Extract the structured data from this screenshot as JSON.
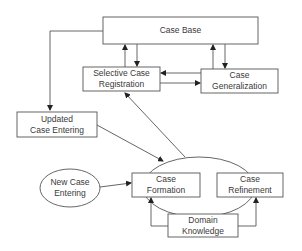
{
  "diagram": {
    "type": "flowchart",
    "colors": {
      "line": "#4a4a4a",
      "text": "#3a3a3a",
      "background": "#ffffff"
    },
    "nodes": {
      "case_base": {
        "shape": "rectangle",
        "label": "Case Base"
      },
      "selective_case_registration": {
        "shape": "rectangle",
        "line1": "Selective Case",
        "line2": "Registration"
      },
      "case_generalization": {
        "shape": "rectangle",
        "line1": "Case",
        "line2": "Generalization"
      },
      "updated_case_entering": {
        "shape": "rectangle",
        "line1": "Updated",
        "line2": "Case Entering"
      },
      "new_case_entering": {
        "shape": "ellipse",
        "line1": "New Case",
        "line2": "Entering"
      },
      "case_formation": {
        "shape": "rectangle",
        "line1": "Case",
        "line2": "Formation"
      },
      "case_refinement": {
        "shape": "rectangle",
        "line1": "Case",
        "line2": "Refinement"
      },
      "domain_knowledge": {
        "shape": "rectangle",
        "line1": "Domain",
        "line2": "Knowledge"
      },
      "processing_group": {
        "shape": "ellipse",
        "label": ""
      }
    },
    "edges": [
      {
        "from": "case_base",
        "to": "updated_case_entering"
      },
      {
        "from": "selective_case_registration",
        "to": "case_base"
      },
      {
        "from": "case_base",
        "to": "selective_case_registration"
      },
      {
        "from": "case_generalization",
        "to": "case_base"
      },
      {
        "from": "case_base",
        "to": "case_generalization"
      },
      {
        "from": "case_generalization",
        "to": "selective_case_registration"
      },
      {
        "from": "selective_case_registration",
        "to": "case_generalization"
      },
      {
        "from": "processing_group",
        "to": "selective_case_registration"
      },
      {
        "from": "updated_case_entering",
        "to": "processing_group"
      },
      {
        "from": "new_case_entering",
        "to": "case_formation"
      },
      {
        "from": "domain_knowledge",
        "to": "case_formation"
      },
      {
        "from": "domain_knowledge",
        "to": "case_refinement"
      }
    ]
  }
}
